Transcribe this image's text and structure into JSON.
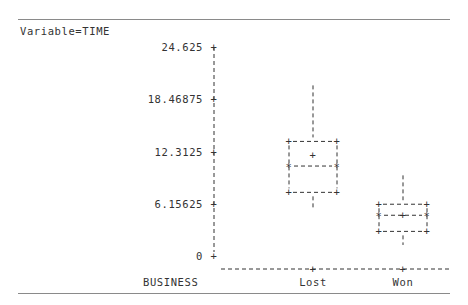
{
  "header": {
    "variable_label": "Variable=TIME"
  },
  "chart_data": {
    "type": "boxplot",
    "title": "Variable=TIME",
    "xlabel": "BUSINESS",
    "ylabel": "",
    "categories": [
      "Lost",
      "Won"
    ],
    "y_ticks": [
      "24.625",
      "18.46875",
      "12.3125",
      "6.15625",
      "0"
    ],
    "y_tick_values": [
      24.625,
      18.46875,
      12.3125,
      6.15625,
      0
    ],
    "ylim": [
      0,
      24.625
    ],
    "grid": false,
    "series": [
      {
        "name": "Lost",
        "whisker_low": 5.7,
        "q1": 7.5,
        "median": 10.6,
        "mean": 11.9,
        "q3": 13.5,
        "whisker_high": 20.1
      },
      {
        "name": "Won",
        "whisker_low": 1.3,
        "q1": 2.9,
        "median": 4.8,
        "mean": 4.8,
        "q3": 6.1,
        "whisker_high": 9.5
      }
    ]
  }
}
